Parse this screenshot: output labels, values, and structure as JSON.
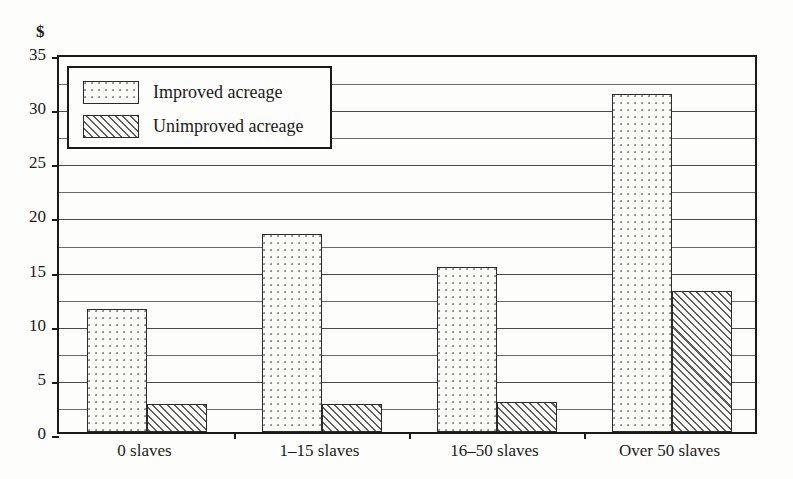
{
  "chart_data": {
    "type": "bar",
    "title": "",
    "subtitle": "",
    "xlabel": "",
    "ylabel": "$",
    "unit_label": "$",
    "ylim": [
      0,
      35
    ],
    "ytick_step": 5,
    "minor_gridline_step": 2.5,
    "grid": true,
    "legend_position": "top-left",
    "categories": [
      "0 slaves",
      "1–15 slaves",
      "16–50 slaves",
      "Over 50 slaves"
    ],
    "yticks": [
      "0",
      "5",
      "10",
      "15",
      "20",
      "25",
      "30",
      "35"
    ],
    "series": [
      {
        "name": "Improved acreage",
        "pattern": "dotted",
        "values": [
          11.4,
          18.3,
          15.2,
          31.2
        ]
      },
      {
        "name": "Unimproved acreage",
        "pattern": "diagonal-hatch",
        "values": [
          2.6,
          2.6,
          2.8,
          13.0
        ]
      }
    ],
    "colors": {
      "axis": "#1a1a1a",
      "gridline": "#4a4a4a",
      "bar_outline": "#2b2b2b",
      "dot_fill": "#8f8f8f",
      "hatch_fill": "#5d5d5d",
      "background": "#fdfdfb"
    }
  },
  "legend": {
    "items": [
      {
        "label": "Improved acreage"
      },
      {
        "label": "Unimproved acreage"
      }
    ]
  }
}
